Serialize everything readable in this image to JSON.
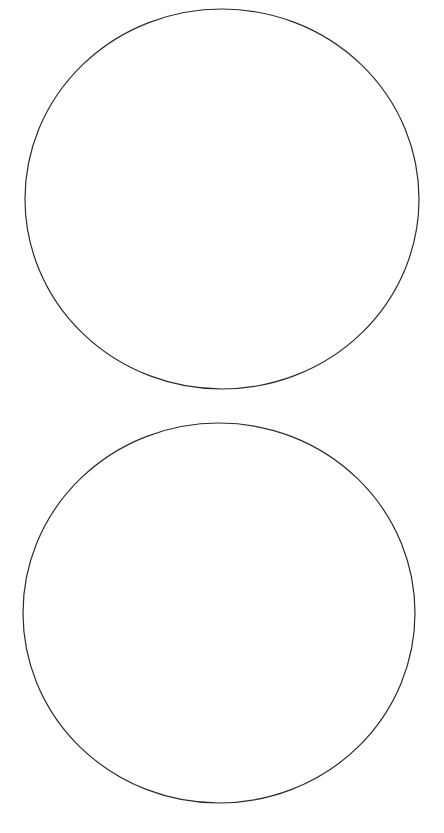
{
  "canvas": {
    "width": 444,
    "height": 833,
    "background": "#ffffff"
  },
  "stroke_color": "#2a2a2a",
  "shapes": [
    {
      "type": "ellipse",
      "name": "top-circle",
      "cx": 222,
      "cy": 199,
      "rx": 197,
      "ry": 190
    },
    {
      "type": "ellipse",
      "name": "bottom-circle",
      "cx": 219,
      "cy": 613,
      "rx": 196,
      "ry": 190
    }
  ]
}
